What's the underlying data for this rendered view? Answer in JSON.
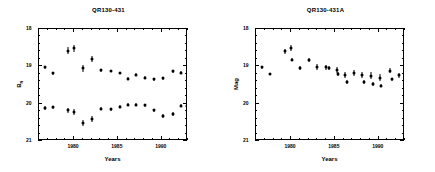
{
  "figure": {
    "background": "#ffffff",
    "marker_color": "#000000"
  },
  "panels": [
    {
      "id": "left",
      "title": "QR130-431",
      "xlabel": "Years",
      "ylabel": "B",
      "ylabel_sub": "N",
      "xticklabels": [
        "1980",
        "1985",
        "1990"
      ],
      "yticklabels": [
        "18",
        "19",
        "20",
        "21"
      ]
    },
    {
      "id": "right",
      "title": "QR130-431A",
      "xlabel": "Years",
      "ylabel": "Mag",
      "ylabel_sub": "",
      "xticklabels": [
        "1980",
        "1985",
        "1990"
      ],
      "yticklabels": [
        "18",
        "19",
        "20",
        "21"
      ]
    }
  ],
  "chart_data": [
    {
      "type": "scatter",
      "panel": "left",
      "title": "QR130-431",
      "xlabel": "Years",
      "ylabel": "B_N",
      "xlim": [
        1976.0,
        1993.0
      ],
      "ylim": [
        21.0,
        18.0
      ],
      "yaxis_inverted": true,
      "xticks": [
        1980,
        1985,
        1990
      ],
      "ymajorticks": [
        18,
        19,
        20,
        21
      ],
      "grid": false,
      "legend": "none",
      "series": [
        {
          "name": "upper branch",
          "points": [
            {
              "x": 1976.7,
              "y": 19.02,
              "yerr": 0.04
            },
            {
              "x": 1977.6,
              "y": 19.18,
              "yerr": 0.04
            },
            {
              "x": 1979.3,
              "y": 18.58,
              "yerr": 0.1
            },
            {
              "x": 1980.0,
              "y": 18.52,
              "yerr": 0.1
            },
            {
              "x": 1981.0,
              "y": 19.05,
              "yerr": 0.09
            },
            {
              "x": 1982.0,
              "y": 18.8,
              "yerr": 0.08
            },
            {
              "x": 1983.1,
              "y": 19.1,
              "yerr": 0.04
            },
            {
              "x": 1984.2,
              "y": 19.12,
              "yerr": 0.03
            },
            {
              "x": 1985.2,
              "y": 19.18,
              "yerr": 0.03
            },
            {
              "x": 1986.2,
              "y": 19.33,
              "yerr": 0.04
            },
            {
              "x": 1987.1,
              "y": 19.22,
              "yerr": 0.04
            },
            {
              "x": 1988.1,
              "y": 19.3,
              "yerr": 0.04
            },
            {
              "x": 1989.1,
              "y": 19.34,
              "yerr": 0.04
            },
            {
              "x": 1990.1,
              "y": 19.32,
              "yerr": 0.04
            },
            {
              "x": 1991.3,
              "y": 19.13,
              "yerr": 0.04
            },
            {
              "x": 1992.2,
              "y": 19.17,
              "yerr": 0.04
            }
          ]
        },
        {
          "name": "lower branch",
          "points": [
            {
              "x": 1976.7,
              "y": 20.12,
              "yerr": 0.05
            },
            {
              "x": 1977.6,
              "y": 20.1,
              "yerr": 0.05
            },
            {
              "x": 1979.3,
              "y": 20.18,
              "yerr": 0.07
            },
            {
              "x": 1980.0,
              "y": 20.22,
              "yerr": 0.08
            },
            {
              "x": 1981.0,
              "y": 20.52,
              "yerr": 0.09
            },
            {
              "x": 1982.0,
              "y": 20.4,
              "yerr": 0.08
            },
            {
              "x": 1983.1,
              "y": 20.13,
              "yerr": 0.05
            },
            {
              "x": 1984.2,
              "y": 20.15,
              "yerr": 0.04
            },
            {
              "x": 1985.2,
              "y": 20.08,
              "yerr": 0.04
            },
            {
              "x": 1986.2,
              "y": 20.03,
              "yerr": 0.04
            },
            {
              "x": 1987.1,
              "y": 20.03,
              "yerr": 0.04
            },
            {
              "x": 1988.1,
              "y": 20.04,
              "yerr": 0.04
            },
            {
              "x": 1989.1,
              "y": 20.18,
              "yerr": 0.05
            },
            {
              "x": 1990.1,
              "y": 20.33,
              "yerr": 0.05
            },
            {
              "x": 1991.3,
              "y": 20.28,
              "yerr": 0.05
            },
            {
              "x": 1992.2,
              "y": 20.05,
              "yerr": 0.04
            },
            {
              "x": 1992.9,
              "y": 20.06,
              "yerr": 0.04
            }
          ]
        }
      ]
    },
    {
      "type": "scatter",
      "panel": "right",
      "title": "QR130-431A",
      "xlabel": "Years",
      "ylabel": "Mag",
      "xlim": [
        1976.0,
        1993.0
      ],
      "ylim": [
        21.0,
        18.0
      ],
      "yaxis_inverted": true,
      "xticks": [
        1980,
        1985,
        1990
      ],
      "ymajorticks": [
        18,
        19,
        20,
        21
      ],
      "grid": false,
      "legend": "none",
      "series": [
        {
          "name": "Mag",
          "points": [
            {
              "x": 1976.7,
              "y": 19.03,
              "yerr": 0.03
            },
            {
              "x": 1977.6,
              "y": 19.2,
              "yerr": 0.03
            },
            {
              "x": 1979.3,
              "y": 18.6,
              "yerr": 0.07
            },
            {
              "x": 1980.0,
              "y": 18.52,
              "yerr": 0.08
            },
            {
              "x": 1980.1,
              "y": 18.82,
              "yerr": 0.04
            },
            {
              "x": 1981.0,
              "y": 19.05,
              "yerr": 0.06
            },
            {
              "x": 1982.0,
              "y": 18.84,
              "yerr": 0.05
            },
            {
              "x": 1983.0,
              "y": 19.02,
              "yerr": 0.09
            },
            {
              "x": 1984.0,
              "y": 19.03,
              "yerr": 0.07
            },
            {
              "x": 1984.3,
              "y": 19.05,
              "yerr": 0.06
            },
            {
              "x": 1985.2,
              "y": 19.1,
              "yerr": 0.07
            },
            {
              "x": 1985.4,
              "y": 19.2,
              "yerr": 0.05
            },
            {
              "x": 1986.2,
              "y": 19.23,
              "yerr": 0.08
            },
            {
              "x": 1986.4,
              "y": 19.42,
              "yerr": 0.05
            },
            {
              "x": 1987.2,
              "y": 19.18,
              "yerr": 0.08
            },
            {
              "x": 1988.1,
              "y": 19.22,
              "yerr": 0.08
            },
            {
              "x": 1988.3,
              "y": 19.42,
              "yerr": 0.05
            },
            {
              "x": 1989.1,
              "y": 19.25,
              "yerr": 0.09
            },
            {
              "x": 1989.3,
              "y": 19.48,
              "yerr": 0.05
            },
            {
              "x": 1990.1,
              "y": 19.3,
              "yerr": 0.09
            },
            {
              "x": 1990.3,
              "y": 19.52,
              "yerr": 0.04
            },
            {
              "x": 1991.3,
              "y": 19.12,
              "yerr": 0.07
            },
            {
              "x": 1991.5,
              "y": 19.35,
              "yerr": 0.05
            },
            {
              "x": 1992.3,
              "y": 19.24,
              "yerr": 0.07
            }
          ]
        }
      ]
    }
  ]
}
